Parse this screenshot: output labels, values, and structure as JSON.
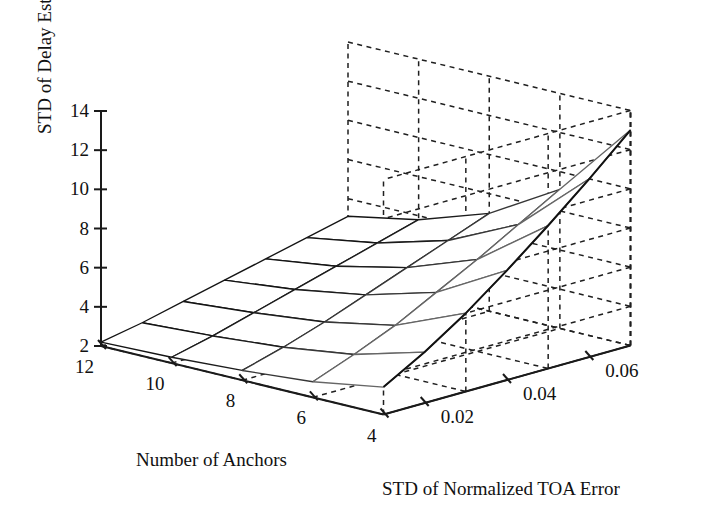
{
  "figure": {
    "kind": "3d-surface-mesh",
    "background": "#ffffff",
    "line_color": "#1a1a1a",
    "grid_color": "#222222"
  },
  "axes": {
    "z": {
      "label": "STD of Delay Estimation (ns)",
      "ticks": [
        "14",
        "12",
        "10",
        "8",
        "6",
        "4",
        "2"
      ],
      "tick_values": [
        14,
        12,
        10,
        8,
        6,
        4,
        2
      ],
      "range": [
        2,
        14
      ]
    },
    "x": {
      "label": "Number of Anchors",
      "ticks": [
        "12",
        "10",
        "8",
        "6",
        "4"
      ],
      "tick_values": [
        12,
        10,
        8,
        6,
        4
      ],
      "range": [
        12,
        4
      ]
    },
    "y": {
      "label": "STD of Normalized TOA Error",
      "ticks": [
        "0.02",
        "0.04",
        "0.06"
      ],
      "tick_values": [
        0.02,
        0.04,
        0.06
      ],
      "range": [
        0.01,
        0.07
      ]
    }
  },
  "chart_data": {
    "type": "surface",
    "title": "",
    "xlabel": "Number of Anchors",
    "ylabel": "STD of Normalized TOA Error",
    "zlabel": "STD of Delay Estimation (ns)",
    "xlim": [
      12,
      4
    ],
    "ylim": [
      0.01,
      0.07
    ],
    "zlim": [
      2,
      14
    ],
    "grid": true,
    "legend": "none",
    "x": [
      12,
      10,
      8,
      6,
      4
    ],
    "y": [
      0.01,
      0.02,
      0.03,
      0.04,
      0.05,
      0.06,
      0.07
    ],
    "z_note": "rows correspond to y (TOA error) ascending, columns to x (anchors) 12->4",
    "z": [
      [
        2.2,
        2.3,
        2.5,
        2.8,
        3.4
      ],
      [
        2.6,
        2.8,
        3.1,
        3.6,
        4.6
      ],
      [
        3.1,
        3.4,
        3.8,
        4.5,
        6.0
      ],
      [
        3.6,
        4.0,
        4.6,
        5.6,
        7.6
      ],
      [
        4.1,
        4.6,
        5.4,
        6.7,
        9.3
      ],
      [
        4.6,
        5.2,
        6.2,
        7.9,
        11.1
      ],
      [
        5.1,
        5.8,
        7.0,
        9.1,
        13.0
      ]
    ]
  }
}
